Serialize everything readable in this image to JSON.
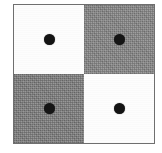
{
  "figure": {
    "name": "checkerboard-four-quadrant-dot-diagram",
    "frame": {
      "border_color": "#6f6f6f",
      "border_width_px": 1,
      "width_px": 142,
      "height_px": 140
    },
    "colors": {
      "white_fill": "#fdfdfd",
      "gray_fill": "#8a8a8a",
      "gray_fill_dark": "#818181",
      "dot_color": "#141414",
      "background": "#ffffff"
    },
    "grid": {
      "rows": 2,
      "columns": 2
    },
    "quadrants": [
      {
        "id": "top-left",
        "position": "top-left",
        "fill": "white",
        "fill_color": "#fdfdfd",
        "dot": true,
        "dot_color": "#141414",
        "dot_diameter_px": 11
      },
      {
        "id": "top-right",
        "position": "top-right",
        "fill": "gray",
        "fill_color": "#8a8a8a",
        "dot": true,
        "dot_color": "#151515",
        "dot_diameter_px": 11
      },
      {
        "id": "bottom-left",
        "position": "bottom-left",
        "fill": "gray",
        "fill_color": "#818181",
        "dot": true,
        "dot_color": "#151515",
        "dot_diameter_px": 11
      },
      {
        "id": "bottom-right",
        "position": "bottom-right",
        "fill": "white",
        "fill_color": "#fdfdfd",
        "dot": true,
        "dot_color": "#141414",
        "dot_diameter_px": 11
      }
    ]
  }
}
